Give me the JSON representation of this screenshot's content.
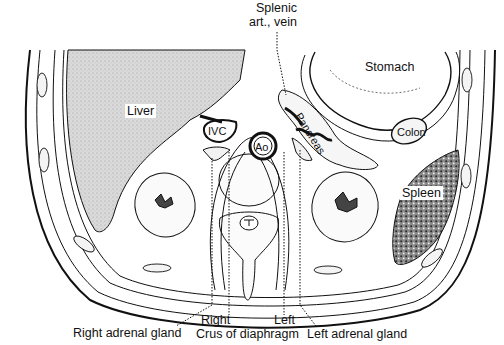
{
  "diagram": {
    "type": "anatomical-cross-section",
    "labels": {
      "splenic_line1": "Splenic",
      "splenic_line2": "art., vein",
      "stomach": "Stomach",
      "liver": "Liver",
      "pancreas": "Pancreas",
      "ivc": "IVC",
      "ao": "Ao",
      "colon": "Colon",
      "spleen": "Spleen",
      "right_adrenal": "Right adrenal gland",
      "right": "Right",
      "crus": "Crus of diaphragm",
      "left": "Left",
      "left_adrenal": "Left adrenal gland"
    },
    "colors": {
      "line": "#111111",
      "liver_fill": "#d9d9d9",
      "spleen_fill": "#5a5a5a",
      "background": "#ffffff"
    }
  }
}
